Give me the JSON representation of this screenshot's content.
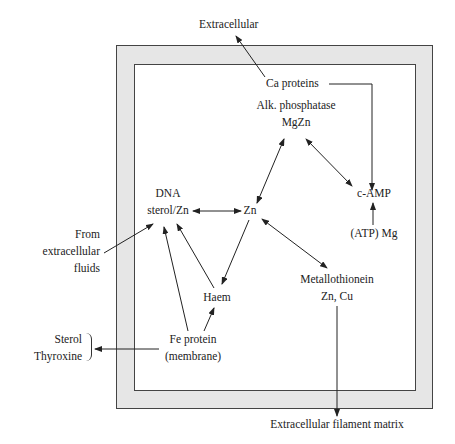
{
  "diagram": {
    "title": "",
    "nodes": {
      "extracellular": "Extracellular",
      "ca_proteins": "Ca proteins",
      "alk_phosphatase": [
        "Alk. phosphatase",
        "MgZn"
      ],
      "camp": "c-AMP",
      "atp_mg": "(ATP) Mg",
      "dna_sterol": [
        "DNA",
        "sterol/Zn"
      ],
      "zn": "Zn",
      "from_extracellular": [
        "From",
        "extracellular",
        "fluids"
      ],
      "haem": "Haem",
      "metallothionein": [
        "Metallothionein",
        "Zn, Cu"
      ],
      "fe_protein": [
        "Fe protein",
        "(membrane)"
      ],
      "sterol_thyroxine": [
        "Sterol",
        "Thyroxine"
      ],
      "filament_matrix": "Extracellular filament matrix"
    },
    "edges": [
      {
        "from": "Ca proteins",
        "to": "Extracellular",
        "type": "directed"
      },
      {
        "from": "Ca proteins",
        "to": "c-AMP",
        "type": "directed"
      },
      {
        "from": "Alk. phosphatase MgZn",
        "to": "c-AMP",
        "type": "bidirectional"
      },
      {
        "from": "Alk. phosphatase MgZn",
        "to": "Zn",
        "type": "bidirectional"
      },
      {
        "from": "(ATP) Mg",
        "to": "c-AMP",
        "type": "directed"
      },
      {
        "from": "sterol/Zn",
        "to": "Zn",
        "type": "bidirectional"
      },
      {
        "from": "From extracellular fluids",
        "to": "sterol/Zn",
        "type": "directed"
      },
      {
        "from": "Zn",
        "to": "Haem",
        "type": "directed"
      },
      {
        "from": "Zn",
        "to": "Metallothionein Zn, Cu",
        "type": "bidirectional"
      },
      {
        "from": "Haem",
        "to": "sterol/Zn",
        "type": "directed"
      },
      {
        "from": "Fe protein (membrane)",
        "to": "sterol/Zn",
        "type": "directed"
      },
      {
        "from": "Fe protein (membrane)",
        "to": "Haem",
        "type": "directed"
      },
      {
        "from": "Fe protein (membrane)",
        "to": "Sterol Thyroxine",
        "type": "directed"
      },
      {
        "from": "Metallothionein Zn, Cu",
        "to": "Extracellular filament matrix",
        "type": "directed"
      }
    ]
  }
}
